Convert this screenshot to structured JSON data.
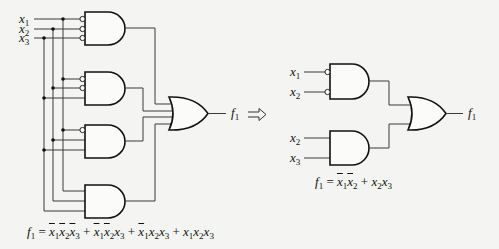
{
  "left_circuit": {
    "inputs": [
      {
        "name": "x",
        "sub": "1"
      },
      {
        "name": "x",
        "sub": "2"
      },
      {
        "name": "x",
        "sub": "3"
      }
    ],
    "and_gates": [
      {
        "id": 1,
        "inverted_inputs": [
          "x1",
          "x2",
          "x3"
        ],
        "term": "x̄1x̄2x̄3"
      },
      {
        "id": 2,
        "inverted_inputs": [
          "x1",
          "x2"
        ],
        "term": "x̄1x̄2x3"
      },
      {
        "id": 3,
        "inverted_inputs": [
          "x1"
        ],
        "term": "x̄1x2x3"
      },
      {
        "id": 4,
        "inverted_inputs": [],
        "term": "x1x2x3"
      }
    ],
    "output": {
      "name": "f",
      "sub": "1"
    },
    "equation": {
      "lhs": "f",
      "lhs_sub": "1",
      "terms": [
        [
          {
            "v": "x",
            "s": "1",
            "bar": true
          },
          {
            "v": "x",
            "s": "2",
            "bar": true
          },
          {
            "v": "x",
            "s": "3",
            "bar": true
          }
        ],
        [
          {
            "v": "x",
            "s": "1",
            "bar": true
          },
          {
            "v": "x",
            "s": "2",
            "bar": true
          },
          {
            "v": "x",
            "s": "3",
            "bar": false
          }
        ],
        [
          {
            "v": "x",
            "s": "1",
            "bar": true
          },
          {
            "v": "x",
            "s": "2",
            "bar": false
          },
          {
            "v": "x",
            "s": "3",
            "bar": false
          }
        ],
        [
          {
            "v": "x",
            "s": "1",
            "bar": false
          },
          {
            "v": "x",
            "s": "2",
            "bar": false
          },
          {
            "v": "x",
            "s": "3",
            "bar": false
          }
        ]
      ]
    }
  },
  "arrow": {
    "symbol": "⟹",
    "meaning": "simplifies-to"
  },
  "right_circuit": {
    "top_and_inputs": [
      {
        "name": "x",
        "sub": "1",
        "inverted": true
      },
      {
        "name": "x",
        "sub": "2",
        "inverted": true
      }
    ],
    "bottom_and_inputs": [
      {
        "name": "x",
        "sub": "2",
        "inverted": false
      },
      {
        "name": "x",
        "sub": "3",
        "inverted": false
      }
    ],
    "output": {
      "name": "f",
      "sub": "1"
    },
    "equation": {
      "lhs": "f",
      "lhs_sub": "1",
      "terms": [
        [
          {
            "v": "x",
            "s": "1",
            "bar": true
          },
          {
            "v": "x",
            "s": "2",
            "bar": true
          }
        ],
        [
          {
            "v": "x",
            "s": "2",
            "bar": false
          },
          {
            "v": "x",
            "s": "3",
            "bar": false
          }
        ]
      ]
    }
  },
  "text": {
    "x": "x",
    "f": "f",
    "s1": "1",
    "s2": "2",
    "s3": "3",
    "eq": " = ",
    "plus": " + "
  }
}
